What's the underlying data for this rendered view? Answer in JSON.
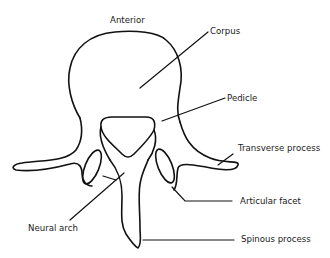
{
  "figure": {
    "orientation_label": "Anterior",
    "labels": {
      "corpus": "Corpus",
      "pedicle": "Pedicle",
      "transverse_process": "Transverse process",
      "articular_facet": "Articular facet",
      "neural_arch": "Neural arch",
      "spinous_process": "Spinous process"
    },
    "colors": {
      "line": "#111111",
      "text": "#1a1a1a",
      "background": "#ffffff"
    }
  }
}
